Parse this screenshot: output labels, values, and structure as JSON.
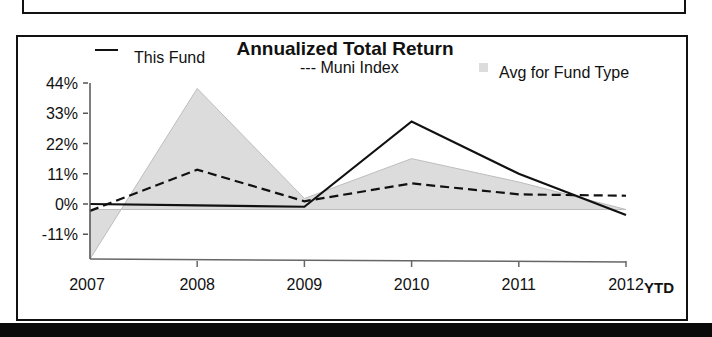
{
  "chart_data": {
    "type": "line",
    "title": "Annualized Total Return",
    "xlabel": "",
    "ylabel": "",
    "categories": [
      "2007",
      "2008",
      "2009",
      "2010",
      "2011",
      "2012"
    ],
    "x_suffix_label": "YTD",
    "y_ticks": [
      "44%",
      "33%",
      "22%",
      "11%",
      "0%",
      "-11%"
    ],
    "y_tick_values": [
      44,
      33,
      22,
      11,
      0,
      -11
    ],
    "ylim": [
      -20,
      44
    ],
    "grid": false,
    "legend_position": "top",
    "series": [
      {
        "name": "This Fund",
        "style": "solid",
        "legend_marker": "—",
        "values": [
          0,
          -0.5,
          -1,
          30,
          11,
          -4
        ]
      },
      {
        "name": "Muni Index",
        "style": "dashed",
        "legend_marker": "---",
        "values": [
          -2.5,
          12.5,
          1,
          7.5,
          3.5,
          3
        ]
      },
      {
        "name": "Avg for Fund Type",
        "style": "area",
        "legend_marker": "shaded-square",
        "values": [
          -20,
          42,
          2,
          16.5,
          8,
          -2
        ]
      }
    ]
  },
  "legend": {
    "this_fund": "This Fund",
    "muni_index": "--- Muni Index",
    "avg_fund_type": "Avg for Fund Type"
  },
  "colors": {
    "line": "#111111",
    "area_fill": "#dcdcdc",
    "area_edge": "#bdbdbd",
    "frame": "#111111"
  }
}
